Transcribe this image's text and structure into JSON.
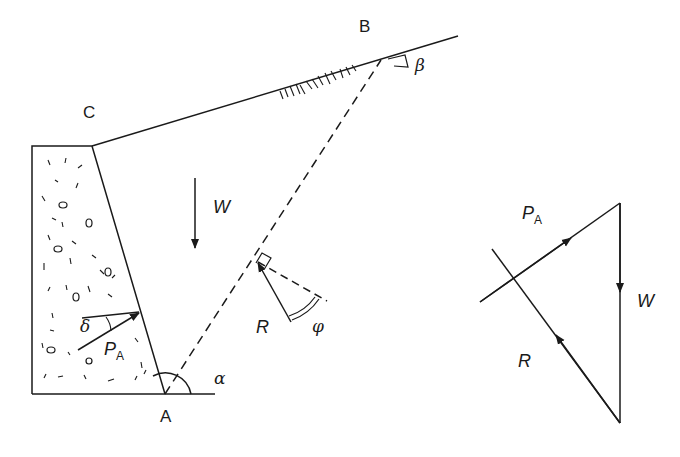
{
  "diagram": {
    "colors": {
      "line": "#1a1a1a",
      "background": "#ffffff"
    },
    "points": {
      "A": {
        "label": "A",
        "x": 165,
        "y": 394
      },
      "B": {
        "label": "B",
        "x": 381,
        "y": 60
      },
      "C": {
        "label": "C",
        "x": 92,
        "y": 146
      }
    },
    "wall": {
      "outline": [
        [
          32,
          146
        ],
        [
          92,
          146
        ],
        [
          165,
          394
        ],
        [
          32,
          394
        ]
      ],
      "fill_pattern": "gravel-dashes"
    },
    "ground_surface": {
      "from": [
        92,
        146
      ],
      "to": [
        458,
        36
      ],
      "hatched": true
    },
    "base_line": {
      "from": [
        32,
        394
      ],
      "to": [
        215,
        394
      ]
    },
    "failure_plane": {
      "from": [
        165,
        394
      ],
      "to": [
        381,
        60
      ],
      "style": "dashed"
    },
    "angles": {
      "alpha": {
        "symbol": "α",
        "at": "A"
      },
      "beta": {
        "symbol": "β",
        "at": "B"
      },
      "delta": {
        "symbol": "δ",
        "at": "wall back"
      },
      "phi": {
        "symbol": "φ",
        "at": "failure plane"
      }
    },
    "forces_on_wedge": {
      "W": {
        "symbol": "W",
        "direction": "down"
      },
      "PA": {
        "symbol": "P",
        "subscript": "A"
      },
      "R": {
        "symbol": "R"
      }
    },
    "force_polygon": {
      "vertices": [
        [
          620,
          203
        ],
        [
          620,
          423
        ],
        [
          481,
          302
        ]
      ],
      "labels": {
        "PA": {
          "symbol": "P",
          "subscript": "A"
        },
        "W": {
          "symbol": "W"
        },
        "R": {
          "symbol": "R"
        }
      }
    }
  }
}
